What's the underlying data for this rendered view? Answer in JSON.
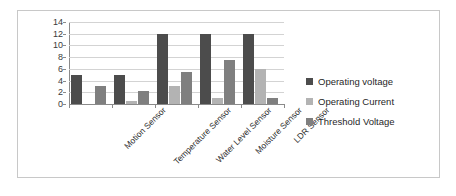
{
  "chart_data": {
    "type": "bar",
    "title": "",
    "xlabel": "",
    "ylabel": "",
    "ylim": [
      0,
      14
    ],
    "yticks": [
      0,
      2,
      4,
      6,
      8,
      10,
      12,
      14
    ],
    "grid": true,
    "legend_position": "right",
    "categories": [
      "Motion Sensor",
      "Temperature Sensor",
      "Water Level Sensor",
      "Moisture Sensor",
      "LDR  Sensor"
    ],
    "series": [
      {
        "name": "Operating voltage",
        "color": "#4c4c4c",
        "values": [
          5,
          5,
          12,
          12,
          12
        ]
      },
      {
        "name": "Operating Current",
        "color": "#b3b3b3",
        "values": [
          0,
          0.5,
          3,
          1,
          6
        ]
      },
      {
        "name": "Threshold Voltage",
        "color": "#7f7f7f",
        "values": [
          3,
          2.3,
          5.5,
          7.5,
          1.1
        ]
      }
    ]
  },
  "figure": {
    "border_color": "#c8c8c8",
    "background": "#ffffff",
    "gridline_color": "#d3d3d3",
    "axis_color": "#8a8a8a"
  }
}
